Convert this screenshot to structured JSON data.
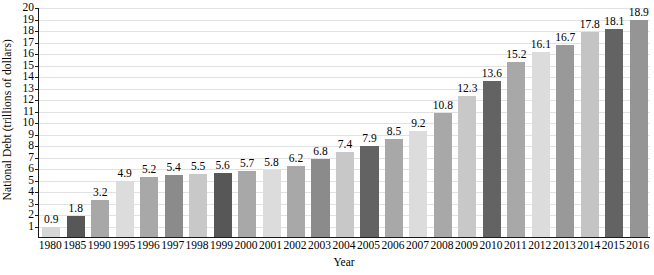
{
  "chart_data": {
    "type": "bar",
    "title": "",
    "xlabel": "Year",
    "ylabel": "National Debt (trillions of dollars)",
    "categories": [
      "1980",
      "1985",
      "1990",
      "1995",
      "1996",
      "1997",
      "1998",
      "1999",
      "2000",
      "2001",
      "2002",
      "2003",
      "2004",
      "2005",
      "2006",
      "2007",
      "2008",
      "2009",
      "2010",
      "2011",
      "2012",
      "2013",
      "2014",
      "2015",
      "2016"
    ],
    "values": [
      0.9,
      1.8,
      3.2,
      4.9,
      5.2,
      5.4,
      5.5,
      5.6,
      5.7,
      5.8,
      6.2,
      6.8,
      7.4,
      7.9,
      8.5,
      9.2,
      10.8,
      12.3,
      13.6,
      15.2,
      16.1,
      16.7,
      17.8,
      18.1,
      18.9
    ],
    "value_labels": [
      "0.9",
      "1.8",
      "3.2",
      "4.9",
      "5.2",
      "5.4",
      "5.5",
      "5.6",
      "5.7",
      "5.8",
      "6.2",
      "6.8",
      "7.4",
      "7.9",
      "8.5",
      "9.2",
      "10.8",
      "12.3",
      "13.6",
      "15.2",
      "16.1",
      "16.7",
      "17.8",
      "18.1",
      "18.9"
    ],
    "bar_colors": [
      "#d6d6d6",
      "#575757",
      "#a8a8a8",
      "#dcdcdc",
      "#a8a8a8",
      "#8b8b8b",
      "#c8c8c8",
      "#575757",
      "#a8a8a8",
      "#dcdcdc",
      "#a8a8a8",
      "#8b8b8b",
      "#c8c8c8",
      "#636363",
      "#a8a8a8",
      "#dcdcdc",
      "#a8a8a8",
      "#c8c8c8",
      "#636363",
      "#a8a8a8",
      "#dcdcdc",
      "#999999",
      "#c4c4c4",
      "#636363",
      "#959595"
    ],
    "ylim": [
      0,
      20
    ],
    "y_ticks": [
      "1",
      "2",
      "3",
      "4",
      "5",
      "6",
      "7",
      "8",
      "9",
      "10",
      "11",
      "12",
      "13",
      "14",
      "15",
      "16",
      "17",
      "18",
      "19",
      "20"
    ],
    "grid": true,
    "legend": "none",
    "axis_color": "#1a1a1a",
    "gridline_color": "#e2e2e2"
  }
}
